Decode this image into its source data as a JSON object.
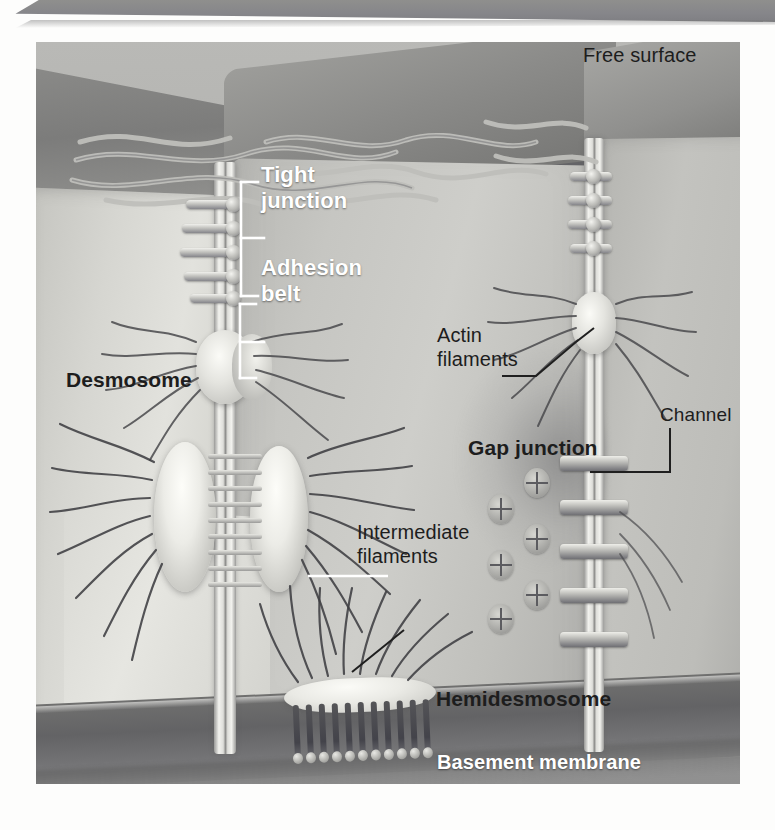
{
  "figure": {
    "style": "grayscale textbook illustration"
  },
  "labels": {
    "free_surface": "Free surface",
    "tight_junction": "Tight\njunction",
    "adhesion_belt": "Adhesion\nbelt",
    "actin_filaments": "Actin\nfilaments",
    "desmosome": "Desmosome",
    "gap_junction": "Gap junction",
    "channel": "Channel",
    "intermediate_filaments": "Intermediate\nfilaments",
    "hemidesmosome": "Hemidesmosome",
    "basement_membrane": "Basement membrane"
  },
  "colors": {
    "label_dark": "#1d1d1d",
    "label_white": "#ffffff",
    "plate_background": "#c9c9c5",
    "basement_membrane_band": "#63636 5",
    "top_band": "#8f8f8d"
  },
  "structures": {
    "tight_junction_strands": 5,
    "desmosome_filament_rungs": 9,
    "gap_junction_channels": 5,
    "connexon_particles": 6,
    "hemidesmosome_anchor_pins": 11,
    "cells_shown": 4
  }
}
